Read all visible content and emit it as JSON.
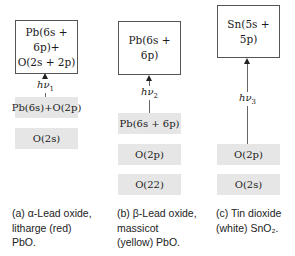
{
  "panels": [
    {
      "id": "a",
      "upper_box": [
        "Pb(6s + 6p)+",
        "O(2s + 2p)"
      ],
      "transition": {
        "symbol": "hν",
        "subscript": "1"
      },
      "levels": [
        "Pb(6s)+O(2p)",
        "O(2s)"
      ],
      "caption": [
        "(a) α-Lead oxide,",
        "litharge (red)",
        "PbO."
      ]
    },
    {
      "id": "b",
      "upper_box": [
        "Pb(6s + 6p)"
      ],
      "transition": {
        "symbol": "hν",
        "subscript": "2"
      },
      "levels": [
        "Pb(6s + 6p)",
        "O(2p)",
        "O(22)"
      ],
      "caption": [
        "(b) β-Lead oxide,",
        "massicot",
        "(yellow) PbO."
      ]
    },
    {
      "id": "c",
      "upper_box": [
        "Sn(5s + 5p)"
      ],
      "transition": {
        "symbol": "hν",
        "subscript": "3"
      },
      "levels": [
        "O(2p)",
        "O(2s)"
      ],
      "caption": [
        "(c) Tin dioxide",
        "(white) SnO₂."
      ]
    }
  ],
  "colors": {
    "band": "#e6e6e6",
    "box_border": "#555555",
    "arrow": "#222222"
  }
}
